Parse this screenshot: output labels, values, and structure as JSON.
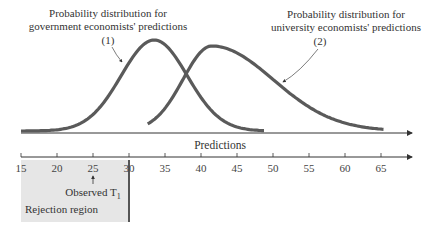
{
  "diagram": {
    "label_gov_line1": "Probability distribution for",
    "label_gov_line2": "government economists' predictions",
    "label_gov_marker": "(1)",
    "label_uni_line1": "Probability distribution for",
    "label_uni_line2": "university economists' predictions",
    "label_uni_marker": "(2)",
    "axis_title": "Predictions",
    "observed_label": "Observed T",
    "observed_subscript": "1",
    "rejection_label": "Rejection region",
    "observed_value": 25,
    "rejection_region": [
      15,
      30
    ]
  },
  "chart_data": {
    "type": "line",
    "xlabel": "Predictions",
    "xlim": [
      15,
      70
    ],
    "ticks": [
      15,
      20,
      25,
      30,
      35,
      40,
      45,
      50,
      55,
      60,
      65
    ],
    "tick_labels": [
      "15",
      "20",
      "25",
      "30",
      "35",
      "40",
      "45",
      "50",
      "55",
      "60",
      "65"
    ],
    "series": [
      {
        "name": "government economists' predictions (1)",
        "range": [
          15,
          48.9
        ],
        "peak": 33.5,
        "spread": 4.6
      },
      {
        "name": "university economists' predictions (2)",
        "range": [
          32.6,
          65.5
        ],
        "peak": 41.5,
        "spread_left": 4.0,
        "spread_right": 8.5
      }
    ],
    "colors": {
      "curve": "#5a5a5a",
      "axis": "#333333",
      "rejection_fill": "#e6e6e6"
    }
  }
}
